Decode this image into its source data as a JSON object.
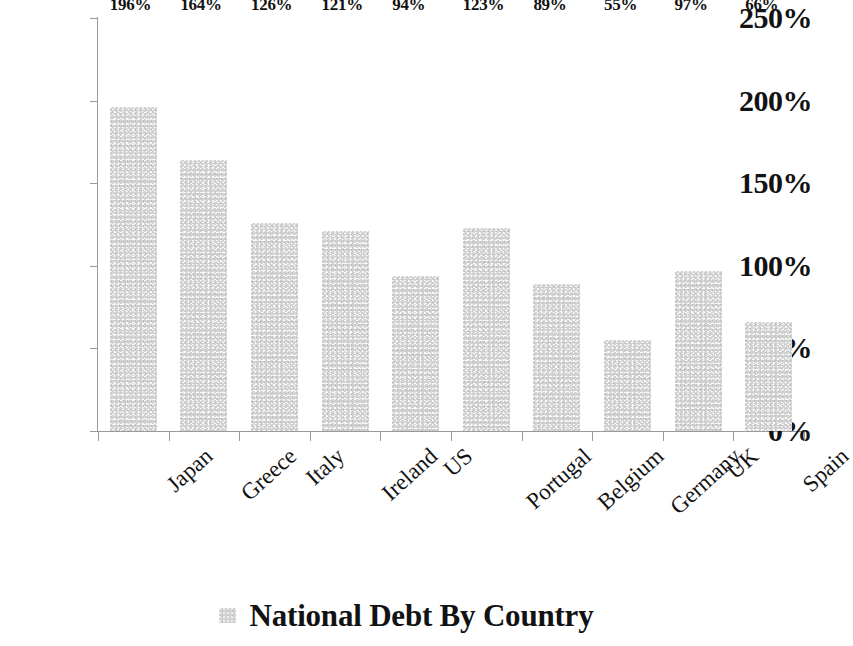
{
  "chart_data": {
    "type": "bar",
    "title": "",
    "xlabel": "",
    "ylabel": "",
    "categories": [
      "Japan",
      "Greece",
      "Italy",
      "Ireland",
      "US",
      "Portugal",
      "Belgium",
      "Germany",
      "UK",
      "Spain"
    ],
    "values": [
      196,
      164,
      126,
      121,
      94,
      123,
      89,
      55,
      97,
      66
    ],
    "data_labels": [
      "196%",
      "164%",
      "126%",
      "121%",
      "94%",
      "123%",
      "89%",
      "55%",
      "97%",
      "66%"
    ],
    "ylim": [
      0,
      250
    ],
    "ytick_values": [
      0,
      50,
      100,
      150,
      200,
      250
    ],
    "ytick_labels": [
      "0%",
      "50%",
      "100%",
      "150%",
      "200%",
      "250%"
    ],
    "grid": false,
    "legend_position": "bottom",
    "legend": [
      {
        "label": "National Debt By Country",
        "color": "#d2d2d2"
      }
    ],
    "series": [
      {
        "name": "National Debt By Country",
        "color": "#d2d2d2",
        "values": [
          196,
          164,
          126,
          121,
          94,
          123,
          89,
          55,
          97,
          66
        ]
      }
    ],
    "axis_color": "#9a9a9a",
    "text_color": "#121212"
  }
}
